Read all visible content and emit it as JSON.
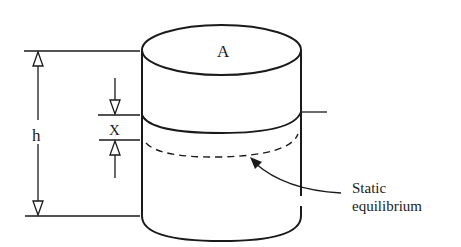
{
  "diagram": {
    "labels": {
      "area": "A",
      "height": "h",
      "displacement": "X",
      "equilibrium_line1": "Static",
      "equilibrium_line2": "equilibrium"
    },
    "colors": {
      "stroke": "#1a1a1a",
      "background": "#ffffff"
    }
  }
}
